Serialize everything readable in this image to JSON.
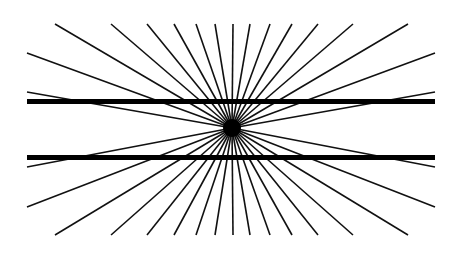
{
  "figure": {
    "name": "Hering illusion",
    "background": "#ffffff",
    "stroke_color": "#111111",
    "center": {
      "x": 232,
      "y": 128
    },
    "center_dot_radius": 9,
    "ray_width": 1.6,
    "ray_endpoints_top": [
      [
        55,
        24
      ],
      [
        111,
        24
      ],
      [
        147,
        24
      ],
      [
        174,
        24
      ],
      [
        196,
        24
      ],
      [
        215,
        24
      ],
      [
        233,
        24
      ],
      [
        250,
        24
      ],
      [
        270,
        24
      ],
      [
        292,
        24
      ],
      [
        318,
        24
      ],
      [
        353,
        24
      ],
      [
        408,
        24
      ]
    ],
    "ray_endpoints_bottom": [
      [
        55,
        235
      ],
      [
        111,
        235
      ],
      [
        147,
        235
      ],
      [
        174,
        235
      ],
      [
        196,
        235
      ],
      [
        215,
        235
      ],
      [
        233,
        235
      ],
      [
        250,
        235
      ],
      [
        270,
        235
      ],
      [
        292,
        235
      ],
      [
        318,
        235
      ],
      [
        353,
        235
      ],
      [
        408,
        235
      ]
    ],
    "ray_endpoints_left": [
      [
        27,
        53
      ],
      [
        27,
        92
      ],
      [
        27,
        167
      ],
      [
        27,
        207
      ]
    ],
    "ray_endpoints_right": [
      [
        435,
        53
      ],
      [
        435,
        92
      ],
      [
        435,
        167
      ],
      [
        435,
        207
      ]
    ],
    "bars": [
      {
        "x1": 27,
        "x2": 435,
        "y": 101.5,
        "thickness": 5
      },
      {
        "x1": 27,
        "x2": 435,
        "y": 157.5,
        "thickness": 5
      }
    ]
  }
}
